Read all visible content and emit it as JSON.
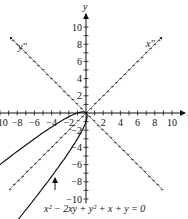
{
  "chart_data": {
    "type": "line",
    "title": "",
    "xlabel": "x",
    "ylabel": "y",
    "rotated_axes": {
      "xpp_label": "x''",
      "ypp_label": "y''",
      "angle_deg": 45
    },
    "xlim": [
      -11,
      11
    ],
    "ylim": [
      -11,
      11
    ],
    "x_ticks": [
      -10,
      -8,
      -6,
      -4,
      -2,
      2,
      4,
      6,
      8,
      10
    ],
    "y_ticks": [
      -10,
      -8,
      -6,
      -4,
      -2,
      2,
      4,
      6,
      8,
      10
    ],
    "equation_label": "x² − 2xy + y² + x + y = 0",
    "series": [
      {
        "name": "x^2 - 2xy + y^2 + x + y = 0",
        "kind": "parabola",
        "vertex": [
          0,
          0
        ],
        "opens": "toward (-1,-1)"
      }
    ],
    "annotations": [
      {
        "text": "arrow pointing to curve",
        "target": "lower branch"
      }
    ]
  }
}
